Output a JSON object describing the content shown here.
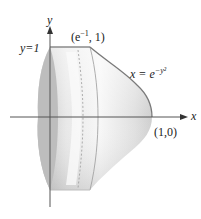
{
  "diagram": {
    "axes": {
      "x_label": "x",
      "y_label": "y"
    },
    "labels": {
      "y_eq_one": "y=1",
      "top_point": "(e",
      "top_point_exp": "−1",
      "top_point_tail": ", 1)",
      "curve_prefix": "x = e",
      "curve_exp": "−y²",
      "right_point": "(1,0)"
    },
    "points": [
      {
        "name": "top corner",
        "x": "e^-1",
        "y": 1
      },
      {
        "name": "axis intersection",
        "x": 1,
        "y": 0
      }
    ],
    "curve": "x = e^(-y^2)",
    "colors": {
      "axis": "#555555",
      "surface_light": "#f2f2f2",
      "surface_dark": "#b8b8b8",
      "edge": "#8a8a8a",
      "text": "#222222"
    }
  }
}
